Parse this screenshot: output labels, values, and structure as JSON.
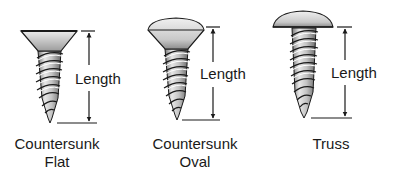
{
  "diagram": {
    "dimension_label": "Length",
    "screws": [
      {
        "id": "countersunk-flat",
        "head_type": "flat",
        "caption_lines": [
          "Countersunk",
          "Flat"
        ]
      },
      {
        "id": "countersunk-oval",
        "head_type": "oval",
        "caption_lines": [
          "Countersunk",
          "Oval"
        ]
      },
      {
        "id": "truss",
        "head_type": "truss",
        "caption_lines": [
          "Truss"
        ]
      }
    ],
    "colors": {
      "ink": "#1a1a1a",
      "metal_light": "#e4e4e4",
      "metal_mid": "#b8b8b8",
      "metal_dark": "#6e6e6e",
      "background": "#ffffff"
    }
  }
}
